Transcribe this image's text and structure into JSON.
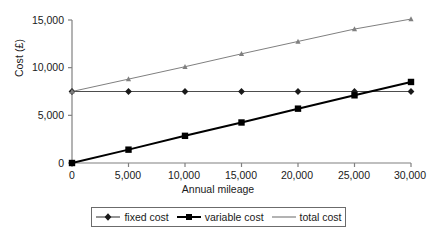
{
  "chart_data": {
    "type": "line",
    "title": "",
    "xlabel": "Annual mileage",
    "ylabel": "Cost (£)",
    "x": [
      0,
      5000,
      10000,
      15000,
      20000,
      25000,
      30000
    ],
    "xlim": [
      0,
      30000
    ],
    "ylim": [
      0,
      15000
    ],
    "xticklabels": [
      "0",
      "5,000",
      "10,000",
      "15,000",
      "20,000",
      "25,000",
      "30,000"
    ],
    "yticklabels": [
      "0",
      "5,000",
      "10,000",
      "15,000"
    ],
    "ytickvalues": [
      0,
      5000,
      10000,
      15000
    ],
    "grid": false,
    "legend_position": "bottom",
    "series": [
      {
        "name": "fixed cost",
        "marker": "diamond",
        "color": "#4d4d4d",
        "marker_color": "#1a1a1a",
        "width": 1,
        "values": [
          7500,
          7500,
          7500,
          7500,
          7500,
          7500,
          7500
        ]
      },
      {
        "name": "variable cost",
        "marker": "square",
        "color": "#000000",
        "marker_color": "#000000",
        "width": 2,
        "values": [
          0,
          1400,
          2850,
          4250,
          5700,
          7100,
          8500
        ]
      },
      {
        "name": "total cost",
        "marker": "triangle",
        "color": "#808080",
        "marker_color": "#808080",
        "width": 1,
        "values": [
          7500,
          8800,
          10100,
          11450,
          12750,
          14050,
          15100
        ]
      }
    ]
  },
  "axis": {
    "y_title": "Cost (£)",
    "x_title": "Annual mileage"
  },
  "legend": {
    "items": [
      {
        "label": "fixed cost"
      },
      {
        "label": "variable cost"
      },
      {
        "label": "total cost"
      }
    ]
  }
}
